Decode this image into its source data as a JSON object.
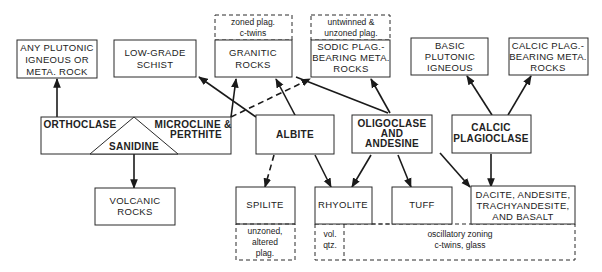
{
  "diagram": {
    "nodes": {
      "any_plutonic": {
        "lines": [
          "ANY PLUTONIC",
          "IGNEOUS OR",
          "META. ROCK"
        ]
      },
      "low_grade_schist": {
        "lines": [
          "LOW-GRADE",
          "SCHIST"
        ]
      },
      "granitic_note": {
        "lines": [
          "zoned plag.",
          "c-twins"
        ]
      },
      "granitic": {
        "lines": [
          "GRANITIC",
          "ROCKS"
        ]
      },
      "sodic_note": {
        "lines": [
          "untwinned &",
          "unzoned plag."
        ]
      },
      "sodic": {
        "lines": [
          "SODIC PLAG.-",
          "BEARING META.",
          "ROCKS"
        ]
      },
      "basic_plutonic": {
        "lines": [
          "BASIC",
          "PLUTONIC",
          "IGNEOUS"
        ]
      },
      "calcic_meta": {
        "lines": [
          "CALCIC PLAG.-",
          "BEARING META.",
          "ROCKS"
        ]
      },
      "orthoclase": {
        "lines": [
          "ORTHOCLASE"
        ]
      },
      "microcline": {
        "lines": [
          "MICROCLINE &",
          "PERTHITE"
        ]
      },
      "sanidine": {
        "lines": [
          "SANIDINE"
        ]
      },
      "albite": {
        "lines": [
          "ALBITE"
        ]
      },
      "oligoclase": {
        "lines": [
          "OLIGOCLASE",
          "AND",
          "ANDESINE"
        ]
      },
      "calcic_plag": {
        "lines": [
          "CALCIC",
          "PLAGIOCLASE"
        ]
      },
      "volcanic": {
        "lines": [
          "VOLCANIC",
          "ROCKS"
        ]
      },
      "spilite": {
        "lines": [
          "SPILITE"
        ]
      },
      "spilite_note": {
        "lines": [
          "unzoned,",
          "altered",
          "plag."
        ]
      },
      "rhyolite": {
        "lines": [
          "RHYOLITE"
        ]
      },
      "rhyolite_note": {
        "lines": [
          "vol.",
          "qtz."
        ]
      },
      "tuff": {
        "lines": [
          "TUFF"
        ]
      },
      "dacite": {
        "lines": [
          "DACITE, ANDESITE,",
          "TRACHYANDESITE,",
          "AND BASALT"
        ]
      },
      "volcanic_note": {
        "lines": [
          "oscillatory zoning",
          "c-twins, glass"
        ]
      }
    },
    "edges": [
      {
        "from": "orthoclase",
        "to": "any_plutonic",
        "style": "solid"
      },
      {
        "from": "sanidine",
        "to": "volcanic",
        "style": "solid"
      },
      {
        "from": "microcline",
        "to": "granitic",
        "style": "solid"
      },
      {
        "from": "microcline",
        "to": "sodic",
        "style": "dashed"
      },
      {
        "from": "albite",
        "to": "low_grade_schist",
        "style": "solid"
      },
      {
        "from": "albite",
        "to": "granitic",
        "style": "solid"
      },
      {
        "from": "albite",
        "to": "spilite",
        "style": "dashed"
      },
      {
        "from": "albite",
        "to": "rhyolite",
        "style": "solid"
      },
      {
        "from": "oligoclase",
        "to": "granitic",
        "style": "solid"
      },
      {
        "from": "oligoclase",
        "to": "sodic",
        "style": "solid"
      },
      {
        "from": "oligoclase",
        "to": "rhyolite",
        "style": "solid"
      },
      {
        "from": "oligoclase",
        "to": "tuff",
        "style": "solid"
      },
      {
        "from": "oligoclase",
        "to": "dacite",
        "style": "solid"
      },
      {
        "from": "calcic_plag",
        "to": "basic_plutonic",
        "style": "solid"
      },
      {
        "from": "calcic_plag",
        "to": "calcic_meta",
        "style": "solid"
      },
      {
        "from": "calcic_plag",
        "to": "dacite",
        "style": "solid"
      }
    ]
  }
}
